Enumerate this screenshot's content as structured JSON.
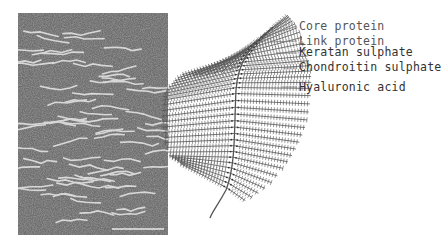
{
  "figure": {
    "micrograph": {
      "description": "Electron micrograph of proteoglycan aggregate",
      "has_scale_bar": true
    },
    "schematic": {
      "labels": [
        {
          "id": "core-protein",
          "text": "Core protein",
          "x": 299,
          "y": 20
        },
        {
          "id": "link-protein",
          "text": "Link protein",
          "x": 299,
          "y": 35
        },
        {
          "id": "keratan-sulphate",
          "text": "Keratan sulphate",
          "x": 299,
          "y": 46
        },
        {
          "id": "chondroitin-sulphate",
          "text": "Chondroitin sulphate",
          "x": 299,
          "y": 61
        },
        {
          "id": "hyaluronic-acid",
          "text": "Hyaluronic acid",
          "x": 299,
          "y": 81
        }
      ]
    },
    "colors": {
      "line": "#555555",
      "micro_bg": "#6a6a6a",
      "micro_fiber": "#dcdcdc"
    }
  }
}
